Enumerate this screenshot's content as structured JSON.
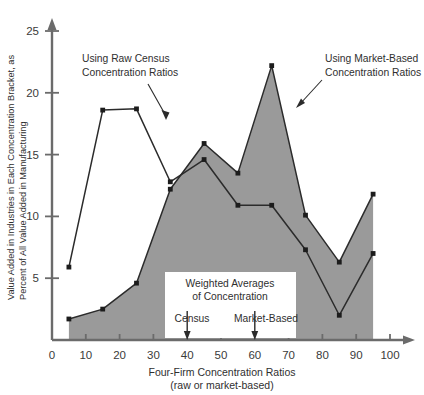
{
  "chart_data": {
    "type": "line",
    "title": "",
    "xlabel": "Four-Firm Concentration Ratios",
    "xlabel_sub": "(raw or market-based)",
    "ylabel": "Value Added in Industries in Each Concentration Bracket, as",
    "ylabel2": "Percent of All Value Added in Manufacturing",
    "x": [
      5,
      15,
      25,
      35,
      45,
      55,
      65,
      75,
      85,
      95
    ],
    "xlim": [
      0,
      100
    ],
    "ylim": [
      0,
      27
    ],
    "xticks": [
      0,
      10,
      20,
      30,
      40,
      50,
      60,
      70,
      80,
      90,
      100
    ],
    "yticks": [
      5,
      10,
      15,
      20,
      25
    ],
    "xtick_labels": [
      "0",
      "10",
      "20",
      "30",
      "40",
      "50",
      "60",
      "70",
      "80",
      "90",
      "100"
    ],
    "ytick_labels": [
      "5",
      "10",
      "15",
      "20",
      "25"
    ],
    "grid": false,
    "legend_position": "inline-annotations",
    "series": [
      {
        "name": "Using Raw Census Concentration Ratios",
        "style": "line-with-markers",
        "values": [
          5.9,
          18.6,
          18.7,
          12.8,
          14.6,
          10.9,
          10.9,
          7.3,
          2.0,
          7.0
        ]
      },
      {
        "name": "Using Market-Based Concentration Ratios",
        "style": "filled-area-with-markers",
        "fill_color": "#9a9a9a",
        "values": [
          1.7,
          2.5,
          4.6,
          12.2,
          15.9,
          13.5,
          22.2,
          10.1,
          6.3,
          11.8
        ]
      }
    ],
    "annotations": [
      {
        "text_line1": "Using Raw Census",
        "text_line2": "Concentration Ratios",
        "target_x": 28,
        "target_y": 17.0
      },
      {
        "text_line1": "Using Market-Based",
        "text_line2": "Concentration Ratios",
        "target_x": 68,
        "target_y": 20.0
      }
    ],
    "inset": {
      "title_line1": "Weighted Averages",
      "title_line2": "of Concentration",
      "markers": [
        {
          "label": "Census",
          "x_value": 40
        },
        {
          "label": "Market-Based",
          "x_value": 60
        }
      ]
    }
  },
  "colors": {
    "area_fill": "#9a9a9a",
    "line": "#2b2b2b",
    "axis": "#6b6b6b",
    "text": "#2f2f2f",
    "background": "#ffffff"
  }
}
